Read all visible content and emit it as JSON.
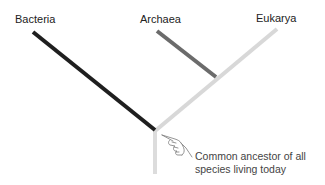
{
  "diagram": {
    "type": "phylogenetic-tree",
    "domains": [
      {
        "name": "Bacteria",
        "color": "#1f1f1f"
      },
      {
        "name": "Archaea",
        "color": "#6b6b6b"
      },
      {
        "name": "Eukarya",
        "color": "#d8d8d8"
      }
    ],
    "trunk_color": "#dcdcdc",
    "annotation": {
      "line1": "Common ancestor of all",
      "line2": "species living today",
      "pointer_icon": "pointing-hand-icon"
    }
  }
}
